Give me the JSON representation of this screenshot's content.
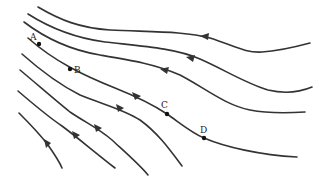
{
  "diagram": {
    "colors": {
      "line": "#333333",
      "background": "#ffffff",
      "point": "#111111"
    },
    "points": [
      {
        "label": "A",
        "x": 39,
        "y": 44
      },
      {
        "label": "B",
        "x": 70,
        "y": 69
      },
      {
        "label": "C",
        "x": 167,
        "y": 114
      },
      {
        "label": "D",
        "x": 204,
        "y": 138
      }
    ],
    "field_lines": 8,
    "arrow_direction": "leftward/upward"
  }
}
